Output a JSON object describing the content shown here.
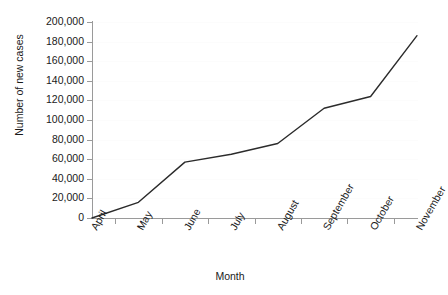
{
  "chart_data": {
    "type": "line",
    "title": "",
    "xlabel": "Month",
    "ylabel": "Number of new cases",
    "categories": [
      "April",
      "May",
      "June",
      "July",
      "August",
      "September",
      "October",
      "November"
    ],
    "values": [
      0,
      16000,
      57000,
      65000,
      76000,
      112000,
      124000,
      186000
    ],
    "series": [
      {
        "name": "Number of new cases",
        "values": [
          0,
          16000,
          57000,
          65000,
          76000,
          112000,
          124000,
          186000
        ]
      }
    ],
    "ylim": [
      0,
      200000
    ],
    "ytick_values": [
      0,
      20000,
      40000,
      60000,
      80000,
      100000,
      120000,
      140000,
      160000,
      180000,
      200000
    ],
    "ytick_labels": [
      "0",
      "20,000",
      "40,000",
      "60,000",
      "80,000",
      "100,000",
      "120,000",
      "140,000",
      "160,000",
      "180,000",
      "200,000"
    ],
    "grid": true,
    "legend": "none",
    "line_color": "#2b2b2b",
    "axis_color": "#9a9a9a",
    "gridline_color": "#fcfcfc",
    "background_color": "#ffffff",
    "markers": "none"
  }
}
